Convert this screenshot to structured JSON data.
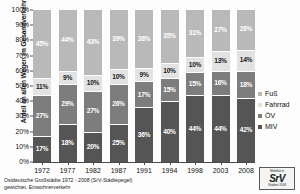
{
  "chart_data": {
    "type": "bar",
    "subtype": "stacked-100-percent",
    "title": "",
    "xlabel": "",
    "ylabel": "Anteil an allen Wegen im Gesamtverkehr",
    "ylim": [
      0,
      100
    ],
    "ytick_labels": [
      "100%",
      "90%",
      "80%",
      "70%",
      "60%",
      "50%",
      "40%",
      "30%",
      "20%",
      "10%",
      "0%"
    ],
    "ytick_values": [
      100,
      90,
      80,
      70,
      60,
      50,
      40,
      30,
      20,
      10,
      0
    ],
    "grid": false,
    "legend_position": "right",
    "categories": [
      "1972",
      "1977",
      "1982",
      "1987",
      "1991",
      "1994",
      "1998",
      "2003",
      "2008"
    ],
    "stack_order_bottom_to_top": [
      "MIV",
      "ÖV",
      "Fahrrad",
      "Fuß"
    ],
    "series": [
      {
        "name": "MIV",
        "color": "#555555",
        "label_color": "#ffffff",
        "values": [
          17,
          27,
          20,
          25,
          36,
          40,
          44,
          44,
          42
        ],
        "value_labels": [
          "17%",
          "18%",
          "20%",
          "25%",
          "36%",
          "40%",
          "44%",
          "44%",
          "42%"
        ]
      },
      {
        "name": "ÖV",
        "color": "#7d7d7d",
        "label_color": "#ffffff",
        "values": [
          27,
          29,
          27,
          26,
          17,
          15,
          15,
          16,
          18
        ],
        "value_labels": [
          "27%",
          "29%",
          "27%",
          "26%",
          "17%",
          "15%",
          "15%",
          "16%",
          "18%"
        ]
      },
      {
        "name": "Fahrrad",
        "color": "#e2e2e2",
        "label_color": "#1b1b1b",
        "values": [
          11,
          9,
          10,
          10,
          9,
          10,
          10,
          13,
          14
        ],
        "value_labels": [
          "11%",
          "9%",
          "10%",
          "10%",
          "9%",
          "10%",
          "10%",
          "13%",
          "14%"
        ]
      },
      {
        "name": "Fuß",
        "color": "#b9b9b9",
        "label_color": "#ffffff",
        "values": [
          45,
          44,
          43,
          39,
          38,
          35,
          31,
          27,
          26
        ],
        "value_labels": [
          "45%",
          "44%",
          "43%",
          "39%",
          "38%",
          "35%",
          "31%",
          "27%",
          "26%"
        ]
      }
    ],
    "legend": [
      {
        "label": "Fuß",
        "color": "#b9b9b9"
      },
      {
        "label": "Fahrrad",
        "color": "#e2e2e2"
      },
      {
        "label": "ÖV",
        "color": "#7d7d7d"
      },
      {
        "label": "MIV",
        "color": "#555555"
      }
    ]
  },
  "footer": {
    "line1": "Ostdeutsche Großstädte 1972 - 2008 (SrV-Städtepegel)",
    "line2": "gewichtet.  Einwohnerverkehr"
  },
  "logo": {
    "caption_top": "Mobilität in",
    "mark": "SrV",
    "caption_bottom": "Städten  2008"
  }
}
